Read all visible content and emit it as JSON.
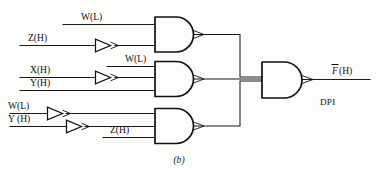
{
  "figure": {
    "caption": "(b)",
    "notation_label": "DPI"
  },
  "output": {
    "name": "F",
    "bar": true,
    "polarity": "(H)",
    "full_label": "F(H)"
  },
  "gates": [
    {
      "id": "and-gate-top",
      "type": "and",
      "output_arrow": true,
      "inputs": [
        {
          "label": "W(L)",
          "var": "W",
          "polarity": "(L)",
          "inverted": false
        },
        {
          "label": "Z(H)",
          "var": "Z",
          "polarity": "(H)",
          "inverted": true
        }
      ]
    },
    {
      "id": "and-gate-middle",
      "type": "and",
      "output_arrow": true,
      "inputs": [
        {
          "label": "W(L)",
          "var": "W",
          "polarity": "(L)",
          "inverted": false
        },
        {
          "label": "X(H)",
          "var": "X",
          "polarity": "(H)",
          "inverted": true
        },
        {
          "label": "Y(H)",
          "var": "Y",
          "polarity": "(H)",
          "inverted": false
        }
      ]
    },
    {
      "id": "and-gate-bottom",
      "type": "and",
      "output_arrow": true,
      "inputs": [
        {
          "label": "W(L)",
          "var": "W",
          "polarity": "(L)",
          "inverted": true
        },
        {
          "label": "Y (H)",
          "var": "Y",
          "polarity": "(H)",
          "inverted": true
        },
        {
          "label": "Z(H)",
          "var": "Z",
          "polarity": "(H)",
          "inverted": false
        }
      ]
    },
    {
      "id": "and-gate-output",
      "type": "and",
      "output_arrow": true,
      "inputs": [
        {
          "label": "",
          "from": "and-gate-top"
        },
        {
          "label": "",
          "from": "and-gate-middle"
        },
        {
          "label": "",
          "from": "and-gate-bottom"
        }
      ]
    }
  ],
  "labels": {
    "top_w": "W(L)",
    "top_z": "Z(H)",
    "mid_w": "W(L)",
    "mid_x": "X(H)",
    "mid_y": "Y(H)",
    "bot_w": "W(L)",
    "bot_y": "Y (H)",
    "bot_z": "Z(H)",
    "out_f_var": "F",
    "out_f_pol": "(H)"
  },
  "colors": {
    "line": "#111111",
    "background": "#fdfdfb",
    "text": "#111111"
  }
}
